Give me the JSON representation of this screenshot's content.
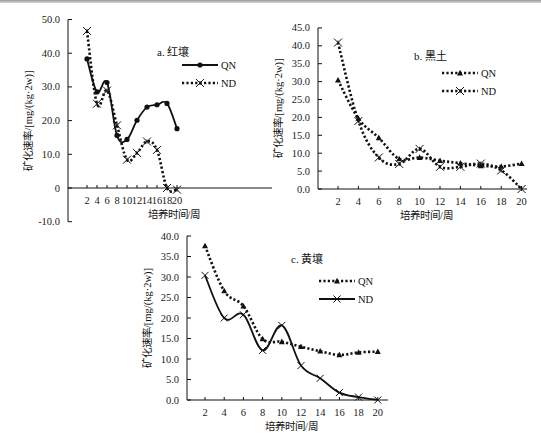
{
  "figure": {
    "background": "#ffffff",
    "line_color": "#111111"
  },
  "chart_data": [
    {
      "id": "a",
      "type": "line",
      "title": "a. 红壤",
      "xlabel": "培养时间/周",
      "ylabel": "矿化速率/[mg/(kg·2w)]",
      "ylim": [
        -10,
        50
      ],
      "yticks": [
        "50.0",
        "40.0",
        "30.0",
        "20.0",
        "10.0",
        "0",
        "-10.0"
      ],
      "ytick_values": [
        50,
        40,
        30,
        20,
        10,
        0,
        -10
      ],
      "xticks": [
        2,
        4,
        6,
        8,
        10,
        12,
        14,
        16,
        18,
        20
      ],
      "grid": false,
      "legend_position": "upper right",
      "x": [
        2,
        4,
        6,
        8,
        10,
        12,
        14,
        16,
        18,
        20
      ],
      "series": [
        {
          "name": "QN",
          "style": "solid",
          "marker": "circle",
          "values": [
            38.3,
            28.5,
            31.3,
            15.6,
            14.4,
            20.1,
            24.0,
            24.7,
            25.1,
            17.6
          ]
        },
        {
          "name": "ND",
          "style": "dotted",
          "marker": "asterisk",
          "values": [
            46.6,
            25.0,
            28.9,
            18.6,
            8.4,
            10.4,
            13.8,
            11.3,
            0.0,
            -0.5
          ]
        }
      ],
      "frame": {
        "x0": 68,
        "y_top": 20,
        "y_zero": 188,
        "px_per_unit": 3.37,
        "x_first": 87,
        "x_step": 10,
        "x_end": 272
      },
      "legend": {
        "x": 218,
        "y1": 65,
        "y2": 83
      },
      "title_pos": {
        "x": 157,
        "y": 56
      }
    },
    {
      "id": "b",
      "type": "line",
      "title": "b. 黑土",
      "xlabel": "培养时间/周",
      "ylabel": "矿化速率/[mg/(kg·2w)]",
      "ylim": [
        0,
        45
      ],
      "yticks": [
        "45.0",
        "40.0",
        "35.0",
        "30.0",
        "25.0",
        "20.0",
        "15.0",
        "10.0",
        "5.0",
        "0.0"
      ],
      "ytick_values": [
        45,
        40,
        35,
        30,
        25,
        20,
        15,
        10,
        5,
        0
      ],
      "xticks": [
        2,
        4,
        6,
        8,
        10,
        12,
        14,
        16,
        18,
        20
      ],
      "grid": false,
      "legend_position": "upper right",
      "x": [
        2,
        4,
        6,
        8,
        10,
        12,
        14,
        16,
        18,
        20
      ],
      "series": [
        {
          "name": "QN",
          "style": "dotted",
          "marker": "triangle",
          "values": [
            30.4,
            19.7,
            14.3,
            8.4,
            8.8,
            7.9,
            7.2,
            6.5,
            6.3,
            7.1
          ]
        },
        {
          "name": "ND",
          "style": "dotted",
          "marker": "asterisk",
          "values": [
            40.9,
            19.0,
            8.8,
            7.0,
            11.2,
            6.2,
            6.2,
            7.1,
            5.2,
            0.0
          ]
        }
      ],
      "frame": {
        "x0": 318,
        "y_top": 28,
        "y_zero": 189,
        "px_per_unit": 3.58,
        "x_first": 338,
        "x_step": 20.4,
        "x_end": 527
      },
      "legend": {
        "x": 478,
        "y1": 73,
        "y2": 91
      },
      "title_pos": {
        "x": 414,
        "y": 60
      }
    },
    {
      "id": "c",
      "type": "line",
      "title": "c. 黄壤",
      "xlabel": "培养时间/周",
      "ylabel": "矿化速率/[mg/(kg·2w)]",
      "ylim": [
        0,
        40
      ],
      "yticks": [
        "40.0",
        "35.0",
        "30.0",
        "25.0",
        "20.0",
        "15.0",
        "10.0",
        "5.0",
        "0.0"
      ],
      "ytick_values": [
        40,
        35,
        30,
        25,
        20,
        15,
        10,
        5,
        0
      ],
      "xticks": [
        2,
        4,
        6,
        8,
        10,
        12,
        14,
        16,
        18,
        20
      ],
      "grid": false,
      "legend_position": "upper right",
      "x": [
        2,
        4,
        6,
        8,
        10,
        12,
        14,
        16,
        18,
        20
      ],
      "series": [
        {
          "name": "QN",
          "style": "dotted",
          "marker": "triangle",
          "values": [
            37.6,
            26.6,
            22.9,
            14.9,
            14.2,
            13.0,
            11.9,
            11.0,
            11.6,
            11.8
          ]
        },
        {
          "name": "ND",
          "style": "solid",
          "marker": "x",
          "values": [
            30.4,
            20.0,
            20.8,
            12.1,
            18.2,
            8.4,
            5.3,
            1.8,
            0.7,
            0.0
          ]
        }
      ],
      "frame": {
        "x0": 187,
        "y_top": 236,
        "y_zero": 400,
        "px_per_unit": 4.1,
        "x_first": 205,
        "x_step": 19.2,
        "x_end": 388
      },
      "legend": {
        "x": 355,
        "y1": 281,
        "y2": 299
      },
      "title_pos": {
        "x": 291,
        "y": 263
      }
    }
  ]
}
